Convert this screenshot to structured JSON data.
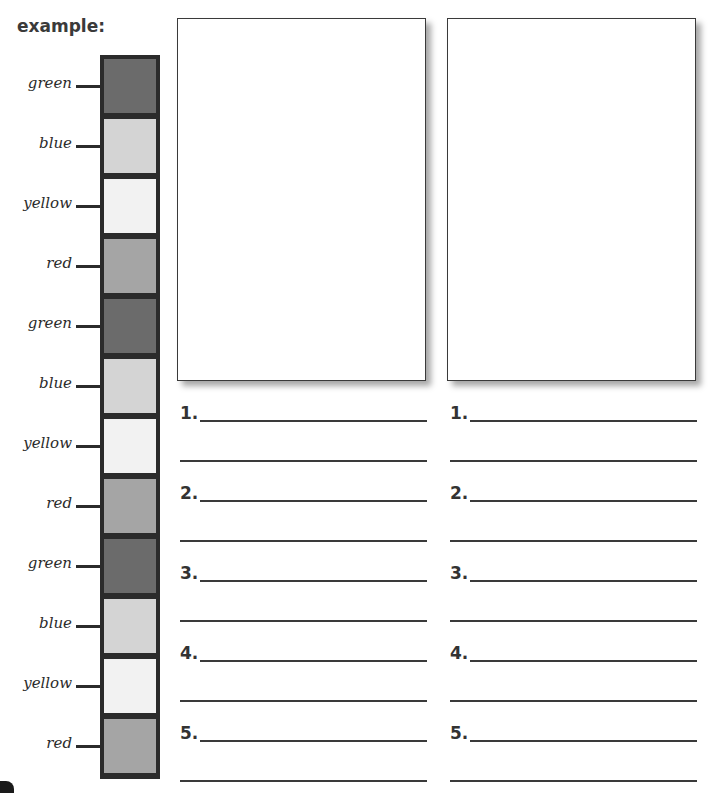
{
  "worksheet": {
    "title": "example:",
    "color_column": [
      {
        "label": "green",
        "color": "#6b6b6b"
      },
      {
        "label": "blue",
        "color": "#d4d4d4"
      },
      {
        "label": "yellow",
        "color": "#f2f2f2"
      },
      {
        "label": "red",
        "color": "#a5a5a5"
      },
      {
        "label": "green",
        "color": "#6b6b6b"
      },
      {
        "label": "blue",
        "color": "#d4d4d4"
      },
      {
        "label": "yellow",
        "color": "#f2f2f2"
      },
      {
        "label": "red",
        "color": "#a5a5a5"
      },
      {
        "label": "green",
        "color": "#6b6b6b"
      },
      {
        "label": "blue",
        "color": "#d4d4d4"
      },
      {
        "label": "yellow",
        "color": "#f2f2f2"
      },
      {
        "label": "red",
        "color": "#a5a5a5"
      }
    ],
    "answer_columns": [
      {
        "numbers": [
          "1.",
          "2.",
          "3.",
          "4.",
          "5."
        ]
      },
      {
        "numbers": [
          "1.",
          "2.",
          "3.",
          "4.",
          "5."
        ]
      }
    ]
  }
}
